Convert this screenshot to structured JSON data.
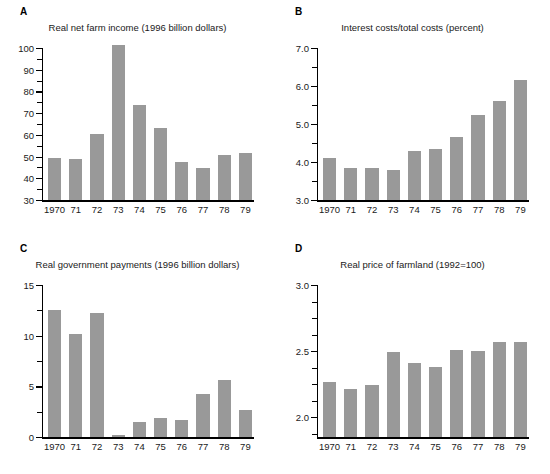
{
  "figure": {
    "width": 550,
    "height": 474,
    "bar_color": "#999999",
    "axis_color": "#000000",
    "text_color": "#1a1a1a"
  },
  "panels": [
    {
      "letter": "A",
      "title": "Real net farm income (1996 billion dollars)",
      "x": 0,
      "y": 0
    },
    {
      "letter": "B",
      "title": "Interest costs/total costs (percent)",
      "x": 275,
      "y": 0
    },
    {
      "letter": "C",
      "title": "Real government payments (1996 billion dollars)",
      "x": 0,
      "y": 237
    },
    {
      "letter": "D",
      "title": "Real price of farmland (1992=100)",
      "x": 275,
      "y": 237
    }
  ],
  "chart_data": [
    {
      "panel": "A",
      "type": "bar",
      "title": "Real net farm income (1996 billion dollars)",
      "xlabel": "",
      "ylabel": "",
      "categories": [
        "1970",
        "71",
        "72",
        "73",
        "74",
        "75",
        "76",
        "77",
        "78",
        "79"
      ],
      "values": [
        49.5,
        49.0,
        60.2,
        101.5,
        73.8,
        63.2,
        47.5,
        44.7,
        50.8,
        51.5
      ],
      "ylim": [
        30,
        100
      ],
      "yticks_major": [
        30,
        40,
        50,
        60,
        70,
        80,
        90,
        100
      ],
      "yticks_minor_step": 5,
      "ytick_labels": [
        "30",
        "40",
        "50",
        "60",
        "70",
        "80",
        "90",
        "100"
      ],
      "grid": false,
      "legend": null
    },
    {
      "panel": "B",
      "type": "bar",
      "title": "Interest costs/total costs (percent)",
      "xlabel": "",
      "ylabel": "",
      "categories": [
        "1970",
        "71",
        "72",
        "73",
        "74",
        "75",
        "76",
        "77",
        "78",
        "79"
      ],
      "values": [
        4.1,
        3.85,
        3.83,
        3.8,
        4.3,
        4.35,
        4.65,
        5.25,
        5.6,
        6.15
      ],
      "ylim": [
        3.0,
        7.0
      ],
      "yticks_major": [
        3.0,
        4.0,
        5.0,
        6.0,
        7.0
      ],
      "yticks_minor_step": 0.5,
      "ytick_labels": [
        "3.0",
        "4.0",
        "5.0",
        "6.0",
        "7.0"
      ],
      "grid": false,
      "legend": null
    },
    {
      "panel": "C",
      "type": "bar",
      "title": "Real government payments (1996 billion dollars)",
      "xlabel": "",
      "ylabel": "",
      "categories": [
        "1970",
        "71",
        "72",
        "73",
        "74",
        "75",
        "76",
        "77",
        "78",
        "79"
      ],
      "values": [
        12.5,
        10.2,
        12.2,
        0.15,
        1.5,
        1.9,
        1.65,
        4.25,
        5.6,
        2.7
      ],
      "ylim": [
        0,
        15
      ],
      "yticks_major": [
        0,
        5,
        10,
        15
      ],
      "yticks_minor_step": 2.5,
      "ytick_labels": [
        "0",
        "5",
        "10",
        "15"
      ],
      "grid": false,
      "legend": null
    },
    {
      "panel": "D",
      "type": "bar",
      "title": "Real price of farmland (1992=100)",
      "xlabel": "",
      "ylabel": "",
      "categories": [
        "1970",
        "71",
        "72",
        "73",
        "74",
        "75",
        "76",
        "77",
        "78",
        "79"
      ],
      "values": [
        2.27,
        2.21,
        2.24,
        2.49,
        2.41,
        2.38,
        2.51,
        2.5,
        2.57,
        2.57
      ],
      "ylim": [
        1.85,
        3.0
      ],
      "yticks_major": [
        2.0,
        2.5,
        3.0
      ],
      "yticks_minor_step": 0.125,
      "ytick_labels": [
        "2.0",
        "2.5",
        "3.0"
      ],
      "grid": false,
      "legend": null
    }
  ]
}
